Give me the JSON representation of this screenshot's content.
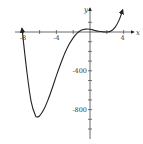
{
  "chart_data": {
    "type": "line",
    "title": "",
    "xlabel": "x",
    "ylabel": "y",
    "xlim": [
      -8.2,
      5
    ],
    "ylim": [
      -1000,
      250
    ],
    "grid": false,
    "legend": null,
    "x_tick_labels": [
      {
        "value": -8,
        "label": "-8"
      },
      {
        "value": -4,
        "label": "-4"
      },
      {
        "value": 4,
        "label": "4"
      }
    ],
    "x_ticks": [
      -8,
      -6,
      -4,
      -2,
      0,
      2,
      4
    ],
    "y_tick_labels": [
      {
        "value": -400,
        "label": "-400"
      },
      {
        "value": -800,
        "label": "-800"
      }
    ],
    "y_ticks": [
      100,
      0,
      -100,
      -200,
      -300,
      -400,
      -500,
      -600,
      -700,
      -800,
      -900,
      -1000
    ],
    "series": [
      {
        "name": "f(x)",
        "color": "#222222",
        "arrows": "both",
        "x": [
          -8.1,
          -7.5,
          -7,
          -6.5,
          -6.25,
          -6,
          -5.5,
          -5,
          -4.5,
          -4,
          -3.5,
          -3,
          -2.5,
          -2,
          -1.5,
          -1,
          -0.5,
          0,
          0.5,
          1,
          1.5,
          2,
          2.5,
          3,
          3.5,
          3.9
        ],
        "y": [
          40,
          -420,
          -720,
          -860,
          -875,
          -865,
          -800,
          -700,
          -580,
          -450,
          -330,
          -220,
          -130,
          -60,
          -10,
          20,
          30,
          28,
          18,
          8,
          2,
          0,
          10,
          50,
          130,
          230
        ]
      }
    ],
    "annotations": []
  }
}
